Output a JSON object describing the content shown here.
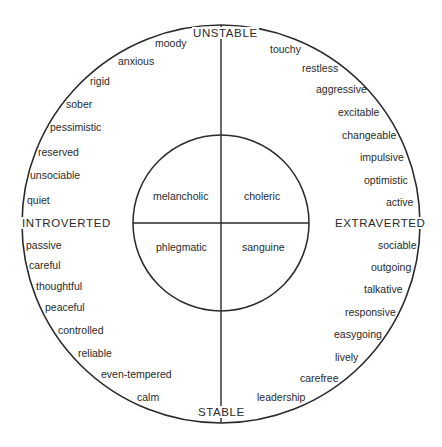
{
  "diagram": {
    "colors": {
      "stroke": "#2a2a2a",
      "background": "#ffffff",
      "text": "#2a2a2a"
    },
    "axes": {
      "top": "UNSTABLE",
      "bottom": "STABLE",
      "left": "INTROVERTED",
      "right": "EXTRAVERTED"
    },
    "temperaments": {
      "top_left": "melancholic",
      "top_right": "choleric",
      "bottom_left": "phlegmatic",
      "bottom_right": "sanguine"
    },
    "traits": {
      "unstable_introverted": [
        "moody",
        "anxious",
        "rigid",
        "sober",
        "pessimistic",
        "reserved",
        "unsociable",
        "quiet"
      ],
      "unstable_extraverted": [
        "touchy",
        "restless",
        "aggressive",
        "excitable",
        "changeable",
        "impulsive",
        "optimistic",
        "active"
      ],
      "stable_introverted": [
        "passive",
        "careful",
        "thoughtful",
        "peaceful",
        "controlled",
        "reliable",
        "even-tempered",
        "calm"
      ],
      "stable_extraverted": [
        "sociable",
        "outgoing",
        "talkative",
        "responsive",
        "easygoing",
        "lively",
        "carefree",
        "leadership"
      ]
    }
  }
}
